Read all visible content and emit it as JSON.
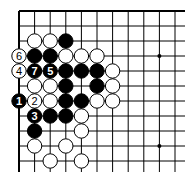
{
  "diagram": {
    "type": "go-board-fragment",
    "visible_columns": 11,
    "visible_rows": 11,
    "edges": [
      "top",
      "left"
    ],
    "colors": {
      "line": "#000000",
      "black_stone": "#000000",
      "white_stone": "#ffffff",
      "background": "#ffffff"
    },
    "star_points": [
      {
        "col": 9,
        "row": 3
      },
      {
        "col": 9,
        "row": 9
      }
    ],
    "stones": [
      {
        "row": 2,
        "col": 1,
        "color": "white",
        "label": ""
      },
      {
        "row": 2,
        "col": 2,
        "color": "white",
        "label": ""
      },
      {
        "row": 2,
        "col": 3,
        "color": "black",
        "label": ""
      },
      {
        "row": 3,
        "col": 0,
        "color": "white",
        "label": "6"
      },
      {
        "row": 3,
        "col": 1,
        "color": "black",
        "label": ""
      },
      {
        "row": 3,
        "col": 2,
        "color": "black",
        "label": ""
      },
      {
        "row": 3,
        "col": 3,
        "color": "white",
        "label": ""
      },
      {
        "row": 3,
        "col": 4,
        "color": "white",
        "label": ""
      },
      {
        "row": 3,
        "col": 5,
        "color": "white",
        "label": ""
      },
      {
        "row": 4,
        "col": 0,
        "color": "white",
        "label": "4"
      },
      {
        "row": 4,
        "col": 1,
        "color": "black",
        "label": "7"
      },
      {
        "row": 4,
        "col": 2,
        "color": "black",
        "label": "5"
      },
      {
        "row": 4,
        "col": 3,
        "color": "black",
        "label": ""
      },
      {
        "row": 4,
        "col": 4,
        "color": "black",
        "label": ""
      },
      {
        "row": 4,
        "col": 5,
        "color": "black",
        "label": ""
      },
      {
        "row": 4,
        "col": 6,
        "color": "white",
        "label": ""
      },
      {
        "row": 5,
        "col": 1,
        "color": "white",
        "label": ""
      },
      {
        "row": 5,
        "col": 2,
        "color": "white",
        "label": ""
      },
      {
        "row": 5,
        "col": 3,
        "color": "black",
        "label": ""
      },
      {
        "row": 5,
        "col": 5,
        "color": "black",
        "label": ""
      },
      {
        "row": 5,
        "col": 6,
        "color": "white",
        "label": ""
      },
      {
        "row": 6,
        "col": 0,
        "color": "black",
        "label": "1"
      },
      {
        "row": 6,
        "col": 1,
        "color": "white",
        "label": "2"
      },
      {
        "row": 6,
        "col": 2,
        "color": "white",
        "label": ""
      },
      {
        "row": 6,
        "col": 3,
        "color": "black",
        "label": ""
      },
      {
        "row": 6,
        "col": 4,
        "color": "black",
        "label": ""
      },
      {
        "row": 6,
        "col": 5,
        "color": "white",
        "label": ""
      },
      {
        "row": 6,
        "col": 6,
        "color": "white",
        "label": ""
      },
      {
        "row": 7,
        "col": 1,
        "color": "black",
        "label": "3"
      },
      {
        "row": 7,
        "col": 2,
        "color": "black",
        "label": ""
      },
      {
        "row": 7,
        "col": 3,
        "color": "black",
        "label": ""
      },
      {
        "row": 7,
        "col": 4,
        "color": "white",
        "label": ""
      },
      {
        "row": 8,
        "col": 1,
        "color": "black",
        "label": ""
      },
      {
        "row": 8,
        "col": 4,
        "color": "white",
        "label": ""
      },
      {
        "row": 9,
        "col": 1,
        "color": "white",
        "label": ""
      },
      {
        "row": 9,
        "col": 3,
        "color": "white",
        "label": ""
      },
      {
        "row": 10,
        "col": 2,
        "color": "white",
        "label": ""
      },
      {
        "row": 10,
        "col": 4,
        "color": "white",
        "label": ""
      }
    ]
  }
}
